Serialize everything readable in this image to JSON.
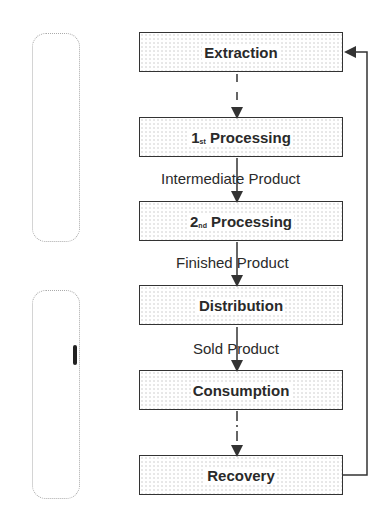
{
  "diagram": {
    "type": "flowchart",
    "nodes": [
      {
        "id": "extraction",
        "label": "Extraction"
      },
      {
        "id": "processing1",
        "prefix": "1",
        "suffix": "st",
        "label": "Processing"
      },
      {
        "id": "processing2",
        "prefix": "2",
        "suffix": "nd",
        "label": "Processing"
      },
      {
        "id": "distribution",
        "label": "Distribution"
      },
      {
        "id": "consumption",
        "label": "Consumption"
      },
      {
        "id": "recovery",
        "label": "Recovery"
      }
    ],
    "edges": [
      {
        "from": "extraction",
        "to": "processing1",
        "style": "dashed",
        "label": ""
      },
      {
        "from": "processing1",
        "to": "processing2",
        "style": "solid",
        "label": "Intermediate Product"
      },
      {
        "from": "processing2",
        "to": "distribution",
        "style": "solid",
        "label": "Finished Product"
      },
      {
        "from": "distribution",
        "to": "consumption",
        "style": "solid",
        "label": "Sold Product"
      },
      {
        "from": "consumption",
        "to": "recovery",
        "style": "dotted",
        "label": ""
      },
      {
        "from": "recovery",
        "to": "extraction",
        "style": "solid",
        "label": ""
      }
    ],
    "colors": {
      "line": "#333333",
      "text": "#2a2a2a",
      "bracket": "#aaaaaa"
    }
  }
}
